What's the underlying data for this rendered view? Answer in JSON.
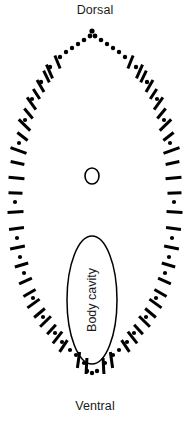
{
  "figure": {
    "title": "",
    "type": "anatomical-cross-section",
    "width": 190,
    "height": 422,
    "background_color": "#ffffff",
    "stroke_color": "#000000"
  },
  "labels": {
    "dorsal": "Dorsal",
    "ventral": "Ventral",
    "body_cavity": "Body cavity"
  },
  "structures": {
    "outline": {
      "name": "body-wall-outline",
      "style": "dotted-and-dashed",
      "description": "Pointed oval body outline, apex at dorsal (top), rounded at ventral (bottom)"
    },
    "inner_circle": {
      "name": "small-circle",
      "center_x": 92,
      "center_y": 176,
      "radius_x": 7,
      "radius_y": 8
    },
    "body_cavity_ellipse": {
      "name": "body-cavity-ellipse",
      "center_x": 92,
      "center_y": 300,
      "radius_x": 25,
      "radius_y": 64
    }
  }
}
